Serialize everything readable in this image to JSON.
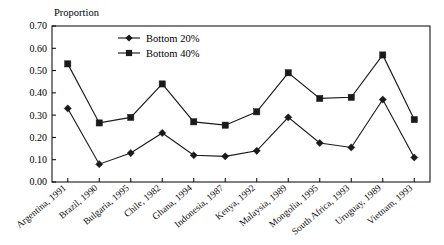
{
  "chart_data": {
    "type": "line",
    "title": "",
    "ylabel": "Proportion",
    "xlabel": "",
    "ylim": [
      0.0,
      0.7
    ],
    "ytick_labels": [
      "0.00",
      "0.10",
      "0.20",
      "0.30",
      "0.40",
      "0.50",
      "0.60",
      "0.70"
    ],
    "ytick_values": [
      0.0,
      0.1,
      0.2,
      0.3,
      0.4,
      0.5,
      0.6,
      0.7
    ],
    "grid": false,
    "legend_position": "top-left-inside",
    "categories": [
      "Argentina, 1991",
      "Brazil, 1990",
      "Bulgaria, 1995",
      "Chile, 1982",
      "Ghana, 1994",
      "Indonesia, 1987",
      "Kenya, 1992",
      "Malaysia, 1989",
      "Mongolia, 1995",
      "South Africa, 1993",
      "Uruguay, 1989",
      "Vietnam, 1993"
    ],
    "series": [
      {
        "name": "Bottom 20%",
        "marker": "diamond",
        "color": "#1a1a1a",
        "values": [
          0.33,
          0.08,
          0.13,
          0.22,
          0.12,
          0.115,
          0.14,
          0.29,
          0.175,
          0.155,
          0.37,
          0.11
        ]
      },
      {
        "name": "Bottom 40%",
        "marker": "square",
        "color": "#1a1a1a",
        "values": [
          0.53,
          0.265,
          0.29,
          0.44,
          0.27,
          0.255,
          0.315,
          0.49,
          0.375,
          0.38,
          0.57,
          0.28
        ]
      }
    ]
  },
  "legend": {
    "items": [
      {
        "label": "Bottom 20%",
        "marker": "diamond"
      },
      {
        "label": "Bottom 40%",
        "marker": "square"
      }
    ]
  }
}
